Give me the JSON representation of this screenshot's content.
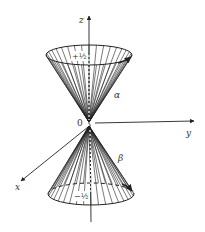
{
  "diagram": {
    "title": "",
    "origin_label": "0",
    "axes": {
      "z": {
        "label": "z"
      },
      "y": {
        "label": "y"
      },
      "x": {
        "label": "x"
      }
    },
    "cones": [
      {
        "name": "upper",
        "spin_label": "+½",
        "state_label": "α"
      },
      {
        "name": "lower",
        "spin_label": "−½",
        "state_label": "β"
      }
    ],
    "colors": {
      "ink": "#222222",
      "label": "#333333",
      "background": "#ffffff"
    },
    "cone_line_count": 36
  }
}
